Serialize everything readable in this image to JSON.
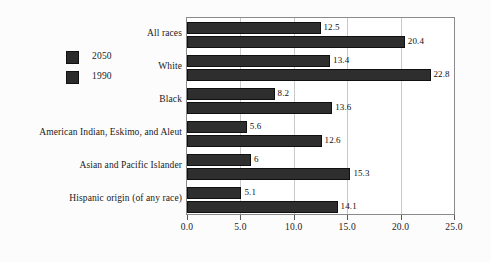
{
  "chart_data": {
    "type": "bar",
    "orientation": "horizontal",
    "title": "",
    "subtitle": "",
    "xlabel": "",
    "ylabel": "",
    "xlim": [
      0.0,
      25.0
    ],
    "xticks": [
      "0.0",
      "5.0",
      "10.0",
      "15.0",
      "20.0",
      "25.0"
    ],
    "xtick_values": [
      0,
      5,
      10,
      15,
      20,
      25
    ],
    "grid": true,
    "grid_axis": "x",
    "legend_position": "left-outside",
    "categories": [
      "All races",
      "White",
      "Black",
      "American Indian, Eskimo, and Aleut",
      "Asian and Pacific Islander",
      "Hispanic origin (of any race)"
    ],
    "series": [
      {
        "name": "2050",
        "color": "#2e2e2e",
        "values": [
          12.5,
          13.4,
          8.2,
          5.6,
          6,
          5.1
        ],
        "labels": [
          "12.5",
          "13.4",
          "8.2",
          "5.6",
          "6",
          "5.1"
        ]
      },
      {
        "name": "1990",
        "color": "#2e2e2e",
        "values": [
          20.4,
          22.8,
          13.6,
          12.6,
          15.3,
          14.1
        ],
        "labels": [
          "20.4",
          "22.8",
          "13.6",
          "12.6",
          "15.3",
          "14.1"
        ]
      }
    ]
  },
  "legend": {
    "items": [
      {
        "label": "2050",
        "color": "#2e2e2e"
      },
      {
        "label": "1990",
        "color": "#2e2e2e"
      }
    ]
  },
  "colors": {
    "bar": "#2e2e2e",
    "bar_border": "#101010",
    "grid": "#c9c9c9",
    "frame": "#8a8a8a",
    "text": "#1a1a1a",
    "background": "#fcfcfc",
    "plot_background": "#ffffff"
  }
}
